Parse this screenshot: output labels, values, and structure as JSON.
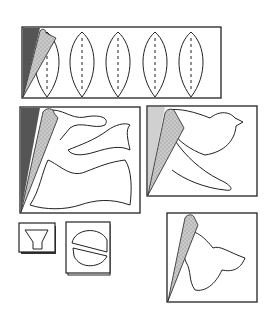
{
  "diagram": {
    "colors": {
      "background": "#ffffff",
      "stroke": "#222222",
      "fold_dark": "#555555",
      "fold_light": "#c8c8c8",
      "fold_dotted": "#b4b4b4"
    },
    "panels": [
      {
        "id": "leaves",
        "shape": "five-leaf-row",
        "fold": "dark",
        "leaf_count": 5
      },
      {
        "id": "wave-fish",
        "shape": "wave-and-fish",
        "fold": "dark"
      },
      {
        "id": "bird",
        "shape": "bird-and-wing",
        "fold": "light"
      },
      {
        "id": "vase",
        "shape": "trapezoid-vase",
        "fold": "none"
      },
      {
        "id": "circle-split",
        "shape": "split-circle",
        "fold": "none"
      },
      {
        "id": "blob",
        "shape": "three-lobe-blob",
        "fold": "light"
      }
    ]
  }
}
